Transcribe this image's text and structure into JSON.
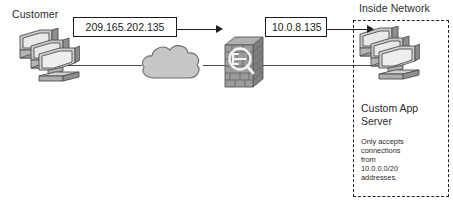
{
  "diagram": {
    "width": 453,
    "height": 207,
    "background": "#ffffff"
  },
  "labels": {
    "customer": "Customer",
    "inside_network": "Inside Network",
    "server_name_line1": "Custom App",
    "server_name_line2": "Server"
  },
  "callouts": {
    "outside_ip": "209.165.202.135",
    "inside_ip": "10.0.8.135"
  },
  "note": {
    "line1": "Only accepts",
    "line2": "connections",
    "line3": "from",
    "line4": "10.0.0.0/20",
    "line5": "addresses."
  },
  "nodes": {
    "customer": {
      "icon": "pc-stack-icon",
      "label": "Customer"
    },
    "cloud": {
      "icon": "network-cloud-icon",
      "label": ""
    },
    "firewall": {
      "icon": "firewall-icon",
      "label": ""
    },
    "server": {
      "icon": "pc-stack-icon",
      "label": "Custom App Server"
    }
  },
  "colors": {
    "line": "#4a4a4a",
    "arrow": "#1f1f1f",
    "box_border": "#1a1a1a",
    "text": "#2b2b2b",
    "icon_light": "#e6e6e6",
    "icon_mid": "#b9b9b9",
    "icon_dark": "#7d7d7d",
    "icon_outline": "#4f4f4f",
    "cloud_fill": "#c7c7c7",
    "brick_fill": "#9a9a9a"
  }
}
